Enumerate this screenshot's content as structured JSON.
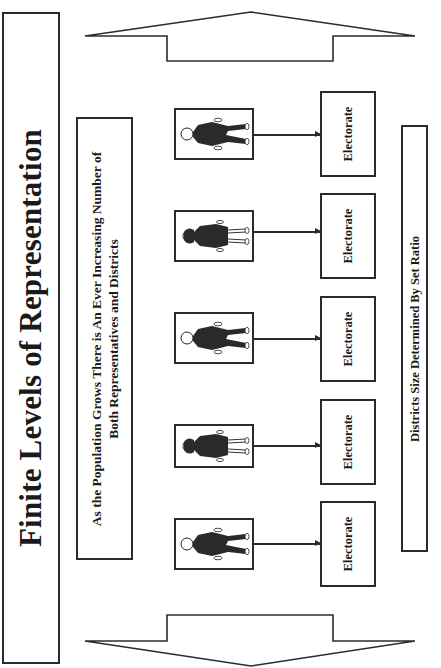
{
  "title": "Finite Levels of Representation",
  "subtitle": {
    "line1": "As the Population Grows There is An Ever Increasing Number of",
    "line2": "Both Representatives and Districts"
  },
  "ratio_note": "Districts Size Determined By Set Ratio",
  "arrows": {
    "top": "up-arrow-icon",
    "bottom": "down-arrow-icon"
  },
  "rows": [
    {
      "representative": "male-representative-icon",
      "electorate": "Electorate"
    },
    {
      "representative": "female-representative-icon",
      "electorate": "Electorate"
    },
    {
      "representative": "male-representative-icon",
      "electorate": "Electorate"
    },
    {
      "representative": "female-representative-icon",
      "electorate": "Electorate"
    },
    {
      "representative": "male-representative-icon",
      "electorate": "Electorate"
    }
  ],
  "colors": {
    "stroke": "#2b2b2b",
    "background": "#ffffff",
    "text": "#1a1a1a"
  }
}
